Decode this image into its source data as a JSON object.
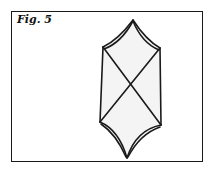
{
  "figure": {
    "caption": "Fig. 5",
    "shape": "hexagonal prism-like outline with concave top/bottom edges and crossing diagonals",
    "stroke_color": "#1a1a1a",
    "fill_color": "#f4f4f4"
  }
}
